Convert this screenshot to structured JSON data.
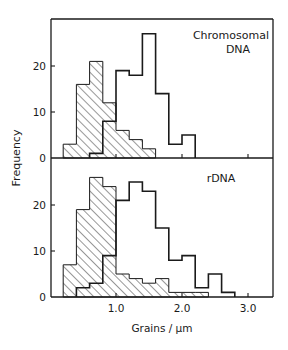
{
  "chart_data": [
    {
      "type": "bar",
      "subtype": "overlaid step histogram",
      "title": "Chromosomal DNA",
      "annotation_lines": [
        "Chromosomal",
        "DNA"
      ],
      "xlabel": "Grains / µm",
      "ylabel": "Frequency",
      "bin_width": 0.2,
      "xlim": [
        0,
        3.4
      ],
      "ylim": [
        0,
        30
      ],
      "x_ticks": [
        1.0,
        2.0,
        3.0
      ],
      "x_tick_labels": [],
      "y_ticks": [
        0,
        10,
        20
      ],
      "y_tick_labels": [
        "0",
        "10",
        "20"
      ],
      "grid": false,
      "legend": null,
      "series": [
        {
          "name": "hatched",
          "style": "hatched",
          "bin_starts": [
            0.2,
            0.4,
            0.6,
            0.8,
            1.0,
            1.2,
            1.4
          ],
          "values": [
            3,
            16,
            21,
            12,
            6,
            4,
            2
          ]
        },
        {
          "name": "open",
          "style": "outline",
          "bin_starts": [
            0.6,
            0.8,
            1.0,
            1.2,
            1.4,
            1.6,
            1.8,
            2.0
          ],
          "values": [
            1,
            8,
            19,
            18,
            27,
            14,
            3,
            5
          ]
        }
      ]
    },
    {
      "type": "bar",
      "subtype": "overlaid step histogram",
      "title": "rDNA",
      "annotation_lines": [
        "rDNA"
      ],
      "xlabel": "Grains / µm",
      "ylabel": "Frequency",
      "bin_width": 0.2,
      "xlim": [
        0,
        3.4
      ],
      "ylim": [
        0,
        30
      ],
      "x_ticks": [
        1.0,
        2.0,
        3.0
      ],
      "x_tick_labels": [
        "1.0",
        "2.0",
        "3.0"
      ],
      "y_ticks": [
        0,
        10,
        20
      ],
      "y_tick_labels": [
        "0",
        "10",
        "20"
      ],
      "grid": false,
      "legend": null,
      "series": [
        {
          "name": "hatched",
          "style": "hatched",
          "bin_starts": [
            0.2,
            0.4,
            0.6,
            0.8,
            1.0,
            1.2,
            1.4,
            1.6,
            1.8,
            2.0,
            2.2
          ],
          "values": [
            7,
            19,
            26,
            24,
            5,
            4,
            3,
            4,
            1,
            1,
            1
          ]
        },
        {
          "name": "open",
          "style": "outline",
          "bin_starts": [
            0.4,
            0.6,
            0.8,
            1.0,
            1.2,
            1.4,
            1.6,
            1.8,
            2.0,
            2.2,
            2.4,
            2.6
          ],
          "values": [
            2,
            3,
            9,
            21,
            25,
            23,
            15,
            8,
            9,
            2,
            5,
            1
          ]
        }
      ]
    }
  ],
  "labels": {
    "ylabel": "Frequency",
    "xlabel": "Grains / µm",
    "top_panel_line1": "Chromosomal",
    "top_panel_line2": "DNA",
    "bottom_panel_label": "rDNA"
  },
  "colors": {
    "ink": "#1a1a1a",
    "background": "#ffffff"
  }
}
